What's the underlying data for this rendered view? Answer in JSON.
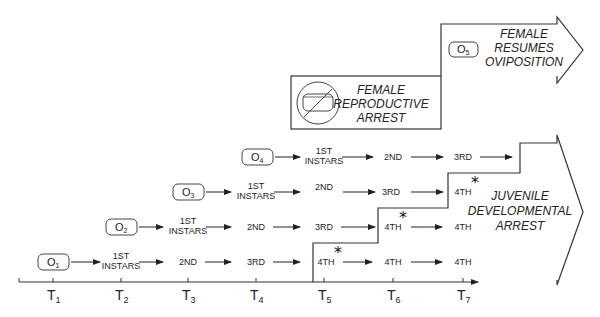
{
  "diagram": {
    "time_axis": {
      "ticks": [
        {
          "base": "T",
          "sub": "1"
        },
        {
          "base": "T",
          "sub": "2"
        },
        {
          "base": "T",
          "sub": "3"
        },
        {
          "base": "T",
          "sub": "4"
        },
        {
          "base": "T",
          "sub": "5"
        },
        {
          "base": "T",
          "sub": "6"
        },
        {
          "base": "T",
          "sub": "7"
        }
      ]
    },
    "oviposition_events": [
      {
        "base": "O",
        "sub": "1"
      },
      {
        "base": "O",
        "sub": "2"
      },
      {
        "base": "O",
        "sub": "3"
      },
      {
        "base": "O",
        "sub": "4"
      },
      {
        "base": "O",
        "sub": "5"
      }
    ],
    "stages": {
      "first_line1": "1ST",
      "first_line2": "INSTARS",
      "second": "2ND",
      "third": "3RD",
      "fourth": "4TH"
    },
    "cohort_rows": [
      {
        "start": "O1",
        "sequence": [
          "1ST INSTARS",
          "2ND",
          "3RD",
          "4TH*",
          "4TH",
          "4TH"
        ]
      },
      {
        "start": "O2",
        "sequence": [
          "1ST INSTARS",
          "2ND",
          "3RD",
          "4TH*",
          "4TH"
        ]
      },
      {
        "start": "O3",
        "sequence": [
          "1ST INSTARS",
          "2ND",
          "3RD",
          "4TH*"
        ]
      },
      {
        "start": "O4",
        "sequence": [
          "1ST INSTARS",
          "2ND",
          "3RD"
        ]
      }
    ],
    "marker": "*",
    "female_reproductive_arrest": {
      "line1": "FEMALE",
      "line2": "REPRODUCTIVE",
      "line3": "ARREST",
      "icon": "no-egg-icon"
    },
    "female_resumes_oviposition": {
      "line1": "FEMALE",
      "line2": "RESUMES",
      "line3": "OVIPOSITION"
    },
    "juvenile_developmental_arrest": {
      "line1": "JUVENILE",
      "line2": "DEVELOPMENTAL",
      "line3": "ARREST"
    }
  }
}
